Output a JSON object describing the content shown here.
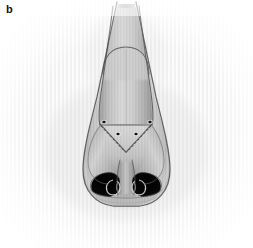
{
  "figure": {
    "panel_label": "b",
    "caption_text": "",
    "view": "nasal base view",
    "medium": "grayscale anatomical illustration",
    "width_px": 253,
    "height_px": 248
  },
  "colors": {
    "background": "#ffffff",
    "paper_tint": "#f4f4f4",
    "stripe_light": "#fbfbfb",
    "stripe_dark": "#eeeeee",
    "skin_light": "#e6e6e6",
    "skin_mid": "#c9c9c9",
    "skin_shadow": "#a6a6a6",
    "cartilage_fill": "#b8b8b8",
    "cartilage_highlight": "#d8d8d8",
    "outline": "#4a4a4a",
    "outline_soft": "#7a7a7a",
    "nostril_dark": "#0d0d0d",
    "suture_dot": "#141414",
    "label_color": "#111111"
  },
  "anatomy": {
    "regions": [
      {
        "name": "nasal-dorsum",
        "label": "dorsum"
      },
      {
        "name": "upper-lateral-cartilage-left",
        "label": "upper lateral cartilage (left)"
      },
      {
        "name": "upper-lateral-cartilage-right",
        "label": "upper lateral cartilage (right)"
      },
      {
        "name": "lower-lateral-cartilage-left",
        "label": "lower lateral cartilage (left)"
      },
      {
        "name": "lower-lateral-cartilage-right",
        "label": "lower lateral cartilage (right)"
      },
      {
        "name": "nasal-tip",
        "label": "tip"
      },
      {
        "name": "columella",
        "label": "columella"
      },
      {
        "name": "nostril-left",
        "label": "left nostril"
      },
      {
        "name": "nostril-right",
        "label": "right nostril"
      },
      {
        "name": "ala-left",
        "label": "left ala"
      },
      {
        "name": "ala-right",
        "label": "right ala"
      },
      {
        "name": "nostril-sill",
        "label": "nostril sill"
      }
    ],
    "suture_points": [
      {
        "name": "suture-point-left-outer",
        "cx": 104,
        "cy": 122
      },
      {
        "name": "suture-point-left-inner",
        "cx": 118,
        "cy": 134
      },
      {
        "name": "suture-point-right-outer",
        "cx": 150,
        "cy": 122
      },
      {
        "name": "suture-point-right-inner",
        "cx": 136,
        "cy": 134
      }
    ],
    "suture_point_count": 4
  }
}
